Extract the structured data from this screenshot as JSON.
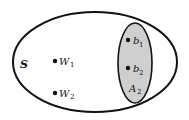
{
  "diagram": {
    "type": "venn-set-diagram",
    "colors": {
      "outline": "#111111",
      "subset_fill": "#cfcfcf",
      "background": "#ffffff"
    },
    "universe": {
      "label": "S"
    },
    "subset": {
      "label": "A",
      "subscript": "2"
    },
    "points": [
      {
        "label": "W",
        "subscript": "1"
      },
      {
        "label": "W",
        "subscript": "2"
      },
      {
        "label": "b",
        "subscript": "1"
      },
      {
        "label": "b",
        "subscript": "2"
      }
    ]
  }
}
